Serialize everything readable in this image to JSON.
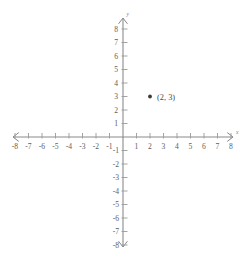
{
  "chart_data": {
    "type": "scatter",
    "title": "",
    "xlabel": "x",
    "ylabel": "y",
    "xlim": [
      -8,
      8
    ],
    "ylim": [
      -8,
      8
    ],
    "grid": false,
    "legend": "none",
    "x_tick_labels": [
      "-8",
      "-7",
      "-6",
      "-5",
      "-4",
      "-3",
      "-2",
      "-1",
      "1",
      "2",
      "3",
      "4",
      "5",
      "6",
      "7",
      "8"
    ],
    "y_tick_labels": [
      "8",
      "7",
      "6",
      "5",
      "4",
      "3",
      "2",
      "1",
      "-1",
      "-2",
      "-3",
      "-4",
      "-5",
      "-6",
      "-7",
      "-8"
    ],
    "x_ticks": [
      -8,
      -7,
      -6,
      -5,
      -4,
      -3,
      -2,
      -1,
      1,
      2,
      3,
      4,
      5,
      6,
      7,
      8
    ],
    "y_ticks": [
      8,
      7,
      6,
      5,
      4,
      3,
      2,
      1,
      -1,
      -2,
      -3,
      -4,
      -5,
      -6,
      -7,
      -8
    ],
    "points": [
      {
        "x": 2,
        "y": 3,
        "label": "(2, 3)"
      }
    ],
    "colors": {
      "background": "#ffffff",
      "axis": "#8a8a8a",
      "tick": "#9a9a9a",
      "tick_label": "#5d5d5d",
      "point": "#3a3a3a",
      "point_label": "#4a4a4a"
    }
  },
  "axes": {
    "x_axis_name": "x",
    "y_axis_name": "y"
  }
}
